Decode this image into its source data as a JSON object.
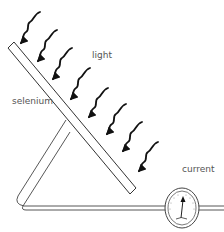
{
  "diagram": {
    "labels": {
      "light": "light",
      "selenium": "selenium",
      "current": "current"
    },
    "components": {
      "plate": "selenium plate",
      "light_rays": 8,
      "circuit": "wire loop",
      "meter": "current meter"
    },
    "colors": {
      "stroke": "#333333",
      "arrow": "#111111",
      "label": "#555555",
      "background": "#ffffff"
    }
  }
}
